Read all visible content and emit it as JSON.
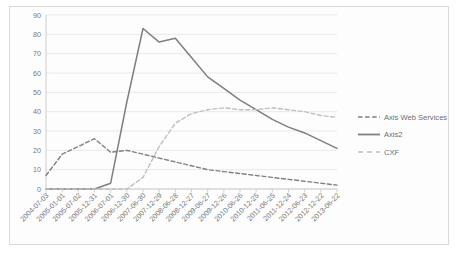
{
  "chart_data": {
    "type": "line",
    "title": "",
    "xlabel": "",
    "ylabel": "",
    "ylim": [
      0,
      90
    ],
    "ytick_step": 10,
    "yticks": [
      "0",
      "10",
      "20",
      "30",
      "40",
      "50",
      "60",
      "70",
      "80",
      "90"
    ],
    "grid": true,
    "legend_position": "right",
    "categories": [
      "2004-07-03",
      "2005-01-01",
      "2005-07-02",
      "2005-12-31",
      "2006-07-01",
      "2006-12-30",
      "2007-06-30",
      "2007-12-29",
      "2008-06-28",
      "2008-12-27",
      "2009-06-27",
      "2009-12-26",
      "2010-06-26",
      "2010-12-25",
      "2011-06-25",
      "2011-12-24",
      "2012-06-23",
      "2012-12-22",
      "2013-06-22"
    ],
    "series": [
      {
        "name": "Axis Web Services",
        "color": "#808080",
        "style": "dashed",
        "values": [
          7,
          18,
          22,
          26,
          19,
          20,
          18,
          16,
          14,
          12,
          10,
          9,
          8,
          7,
          6,
          5,
          4,
          3,
          2
        ]
      },
      {
        "name": "Axis2",
        "color": "#7f7f7f",
        "style": "solid",
        "values": [
          0,
          0,
          0,
          0,
          3,
          45,
          83,
          76,
          78,
          68,
          58,
          52,
          46,
          41,
          36,
          32,
          29,
          25,
          21
        ]
      },
      {
        "name": "CXF",
        "color": "#bfbfbf",
        "style": "dashed",
        "values": [
          0,
          0,
          0,
          0,
          0,
          0,
          6,
          22,
          34,
          39,
          41,
          42,
          41,
          41,
          42,
          41,
          40,
          38,
          37
        ]
      }
    ]
  },
  "legend": {
    "items": [
      {
        "label": "Axis Web Services",
        "color": "#808080",
        "style": "dashed"
      },
      {
        "label": "Axis2",
        "color": "#7f7f7f",
        "style": "solid"
      },
      {
        "label": "CXF",
        "color": "#bfbfbf",
        "style": "dashed"
      }
    ]
  },
  "colors": {
    "plot_background": "#ffffff",
    "frame_background": "#fdfdfd",
    "frame_border": "#d9d9d9",
    "gridline": "#e3e3e3",
    "axis_line": "#c8c8c8",
    "tick_text": "#7a7a7a"
  }
}
